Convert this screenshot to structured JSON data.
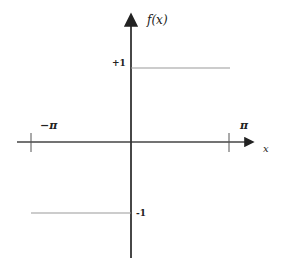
{
  "diagram": {
    "type": "square-wave-plot",
    "y_axis_label": "f(x)",
    "x_axis_label": "x",
    "y_tick_labels": {
      "upper": "+1",
      "lower": "-1"
    },
    "x_tick_labels": {
      "left": "−π",
      "right": "π"
    },
    "segments": [
      {
        "from": "-π",
        "to": "0",
        "value": -1
      },
      {
        "from": "0",
        "to": "π",
        "value": 1
      }
    ],
    "colors": {
      "axis": "#333333",
      "function_line": "#999999"
    }
  }
}
